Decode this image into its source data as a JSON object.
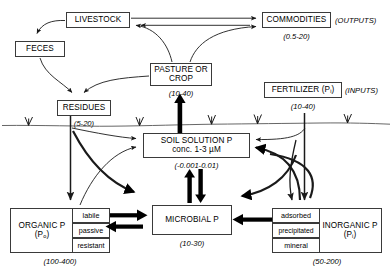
{
  "diagram": {
    "units_note": "values in kg P per hectare",
    "colors": {
      "stroke": "#3a3a3a",
      "arrow_thin": "#1a1a1a",
      "arrow_thick": "#000000",
      "soil_line": "#555555",
      "background": "#ffffff"
    }
  },
  "nodes": {
    "livestock": {
      "label": "LIVESTOCK"
    },
    "feces": {
      "label": "FECES"
    },
    "commodities": {
      "label": "COMMODITIES",
      "value": "(0.5-20)",
      "tag": "(OUTPUTS)"
    },
    "pasture_crop": {
      "label": "PASTURE OR\nCROP",
      "line1": "PASTURE OR",
      "line2": "CROP",
      "value": "(10-40)"
    },
    "fertilizer": {
      "label": "FERTILIZER (P",
      "sub": "i",
      "label_end": ")",
      "value": "(10-40)",
      "tag": "(INPUTS)"
    },
    "residues": {
      "label": "RESIDUES",
      "value": "(5-20)"
    },
    "soil_solution": {
      "line1": "SOIL SOLUTION P",
      "line2": "conc. 1-3 µM",
      "value": "(-0.001-0.01)"
    },
    "microbial": {
      "label": "MICROBIAL P",
      "value": "(10-30)"
    },
    "organic_p": {
      "line1": "ORGANIC P",
      "line2_pre": "(P",
      "line2_sub": "o",
      "line2_post": ")",
      "value": "(100-400)",
      "fractions": [
        "labile",
        "passive",
        "resistant"
      ]
    },
    "inorganic_p": {
      "line1": "INORGANIC P",
      "line2_pre": "(P",
      "line2_sub": "i",
      "line2_post": ")",
      "value": "(50-200)",
      "fractions": [
        "adsorbed",
        "precipitated",
        "mineral"
      ]
    }
  },
  "flows": [
    {
      "from": "livestock",
      "to": "feces",
      "style": "thin-curve"
    },
    {
      "from": "livestock",
      "to": "commodities",
      "style": "thin-straight"
    },
    {
      "from": "pasture_crop",
      "to": "commodities",
      "style": "thin-curve"
    },
    {
      "from": "pasture_crop",
      "to": "livestock",
      "style": "thin-curve"
    },
    {
      "from": "feces",
      "to": "residues",
      "style": "thin-curve"
    },
    {
      "from": "pasture_crop",
      "to": "residues",
      "style": "thin-curve"
    },
    {
      "from": "soil_solution",
      "to": "pasture_crop",
      "style": "thick-straight"
    },
    {
      "from": "residues",
      "to": "soil_solution",
      "style": "thin-curve"
    },
    {
      "from": "residues",
      "to": "organic_p",
      "style": "thin-straight"
    },
    {
      "from": "residues",
      "to": "microbial",
      "style": "thick-curve"
    },
    {
      "from": "organic_p",
      "to": "soil_solution",
      "style": "thin-curve"
    },
    {
      "from": "organic_p",
      "to": "microbial",
      "style": "thick-straight"
    },
    {
      "from": "microbial",
      "to": "organic_p",
      "style": "thick-straight"
    },
    {
      "from": "soil_solution",
      "to": "microbial",
      "style": "thick-straight"
    },
    {
      "from": "microbial",
      "to": "soil_solution",
      "style": "thick-straight"
    },
    {
      "from": "inorganic_p",
      "to": "soil_solution",
      "style": "thick-curve"
    },
    {
      "from": "inorganic_p",
      "to": "microbial",
      "style": "thick-curve"
    },
    {
      "from": "fertilizer",
      "to": "soil_solution",
      "style": "thin-curve"
    },
    {
      "from": "fertilizer",
      "to": "inorganic_p",
      "style": "thin-straight"
    }
  ],
  "soil_surface": {
    "name": "soil-surface-line",
    "grass_tufts": 5
  }
}
